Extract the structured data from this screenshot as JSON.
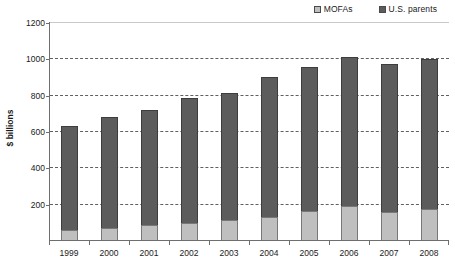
{
  "chart_data": {
    "type": "bar",
    "subtype": "stacked-vertical",
    "title": "",
    "xlabel": "",
    "ylabel": "$ billions",
    "ylim": [
      0,
      1200
    ],
    "ytick_values": [
      0,
      200,
      400,
      600,
      800,
      1000,
      1200
    ],
    "ytick_labels": [
      "0",
      "200",
      "400",
      "600",
      "800",
      "1000",
      "1200"
    ],
    "grid": "horizontal-dashed",
    "legend_position": "top-right",
    "categories": [
      "1999",
      "2000",
      "2001",
      "2002",
      "2003",
      "2004",
      "2005",
      "2006",
      "2007",
      "2008"
    ],
    "series": [
      {
        "name": "MOFAs",
        "color": "#bfbfbf",
        "values": [
          55,
          67,
          80,
          92,
          110,
          128,
          158,
          185,
          152,
          170
        ]
      },
      {
        "name": "U.S. parents",
        "color": "#5c5c5c",
        "values": [
          575,
          611,
          638,
          691,
          702,
          767,
          792,
          823,
          818,
          828
        ]
      }
    ],
    "totals": [
      630,
      678,
      718,
      783,
      812,
      895,
      950,
      1008,
      970,
      998
    ]
  },
  "legend": {
    "entries": [
      {
        "label": "MOFAs",
        "swatch_class": "mofas"
      },
      {
        "label": "U.S. parents",
        "swatch_class": "parents"
      }
    ]
  },
  "axis": {
    "y_title": "$ billions"
  },
  "colors": {
    "mofas": "#bfbfbf",
    "parents": "#5c5c5c",
    "axis": "#6e6e6e",
    "grid": "#606060",
    "background": "#ffffff"
  }
}
